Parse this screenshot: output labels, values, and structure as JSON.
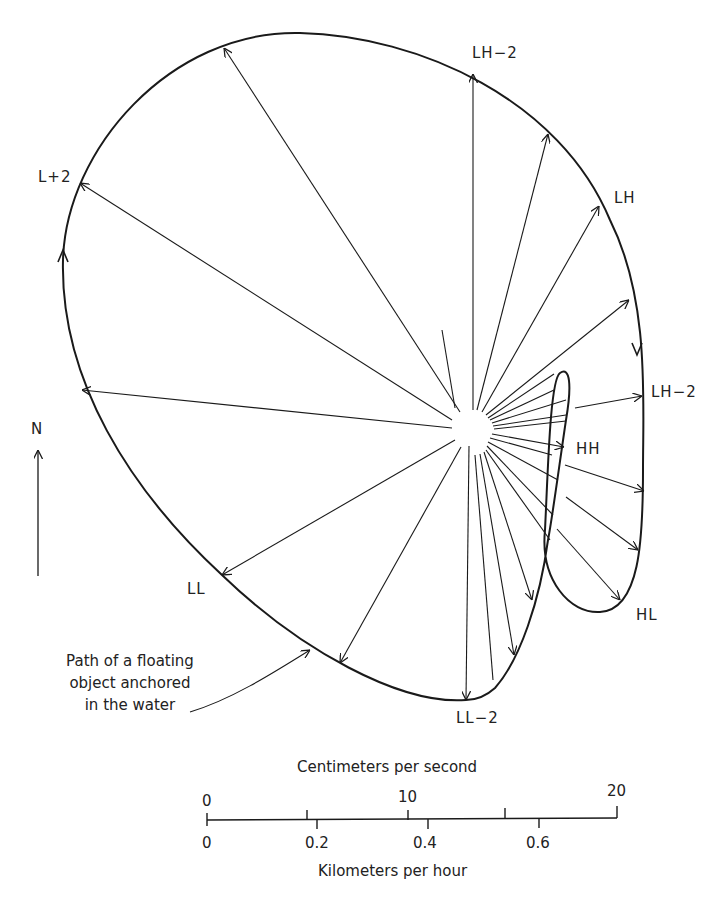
{
  "labels": {
    "lh2_top": "LH−2",
    "l_plus2": "L+2",
    "lh": "LH",
    "lh2_right": "LH−2",
    "hh": "HH",
    "hl": "HL",
    "ll": "LL",
    "ll2": "LL−2",
    "north": "N"
  },
  "caption": {
    "line1": "Path of a floating",
    "line2": "object anchored",
    "line3": "in the water"
  },
  "scale": {
    "top_title": "Centimeters per second",
    "bottom_title": "Kilometers per hour",
    "cm_ticks": [
      "0",
      "10",
      "20"
    ],
    "km_ticks": [
      "0",
      "0.2",
      "0.4",
      "0.6"
    ]
  },
  "colors": {
    "line": "#1a1a1a",
    "background": "#ffffff"
  }
}
